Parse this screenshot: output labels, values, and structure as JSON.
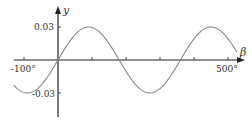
{
  "chart_data": {
    "type": "line",
    "title": "",
    "xlabel": "β",
    "ylabel": "y",
    "function": "y = 0.03 sin(β)",
    "xlim": [
      -130,
      527
    ],
    "ylim": [
      -0.05,
      0.05
    ],
    "x_ticks": [
      -100,
      0,
      100,
      200,
      300,
      400,
      500
    ],
    "x_tick_labels": [
      "-100°",
      "500°"
    ],
    "y_ticks": [
      0.03,
      -0.03
    ],
    "y_tick_labels": [
      "0.03",
      "-0.03"
    ],
    "grid": false,
    "legend": null,
    "series": [
      {
        "name": "y",
        "x": [
          -130,
          -90,
          0,
          90,
          180,
          270,
          360,
          450,
          527
        ],
        "values": [
          -0.023,
          -0.03,
          0,
          0.03,
          0,
          -0.03,
          0,
          0.03,
          0.024
        ]
      }
    ],
    "colors": {
      "curve": "#888888",
      "axes": "#222222"
    }
  }
}
